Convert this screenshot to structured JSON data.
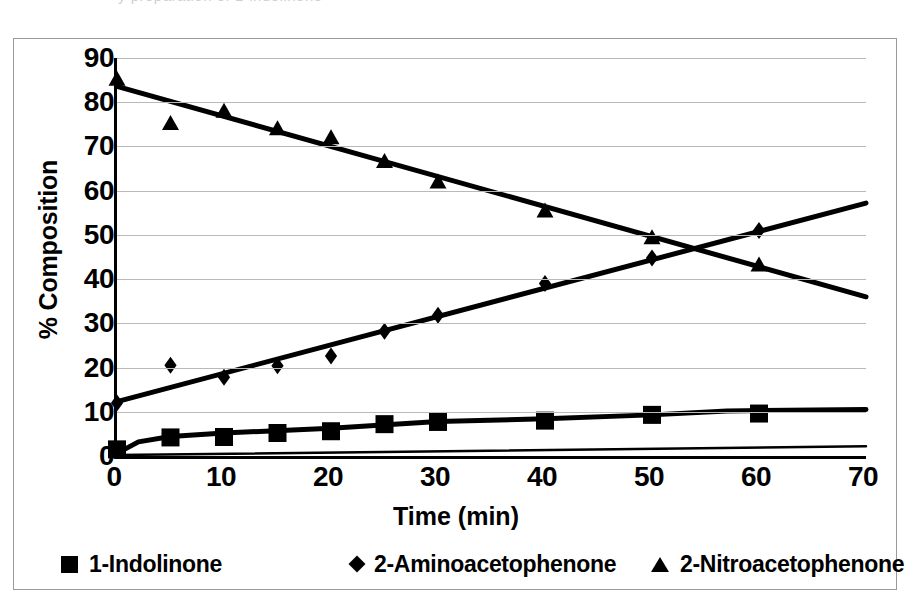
{
  "figure": {
    "top_crop_artifact": "y preparation of 1-indolinone"
  },
  "chart_data": {
    "type": "scatter",
    "title": "",
    "xlabel": "Time (min)",
    "ylabel": "% Composition",
    "xlim": [
      0,
      70
    ],
    "ylim": [
      0,
      90
    ],
    "xticks": [
      0,
      10,
      20,
      30,
      40,
      50,
      60,
      70
    ],
    "yticks": [
      0,
      10,
      20,
      30,
      40,
      50,
      60,
      70,
      80,
      90
    ],
    "grid": "horizontal",
    "legend_position": "bottom",
    "marker_color": "#000000",
    "line_color": "#000000",
    "series": [
      {
        "name": "1-Indolinone",
        "marker": "square",
        "x": [
          0,
          5,
          10,
          15,
          20,
          25,
          30,
          40,
          50,
          60
        ],
        "values": [
          1.5,
          4.2,
          4.3,
          5.2,
          5.6,
          7.2,
          7.7,
          8.0,
          9.3,
          9.6
        ],
        "trend_x": [
          0,
          2,
          5,
          10,
          20,
          30,
          40,
          50,
          57,
          70
        ],
        "trend_y": [
          0.6,
          3.2,
          4.4,
          5.2,
          6.3,
          7.8,
          8.4,
          9.3,
          10.2,
          10.5
        ]
      },
      {
        "name": "2-Aminoacetophenone",
        "marker": "diamond",
        "x": [
          0,
          5,
          10,
          15,
          20,
          25,
          30,
          40,
          50,
          60
        ],
        "values": [
          12.0,
          20.5,
          17.8,
          20.4,
          22.6,
          28.2,
          31.8,
          39.0,
          44.8,
          51.0
        ],
        "trend_x": [
          0,
          70
        ],
        "trend_y": [
          12.3,
          57.2
        ]
      },
      {
        "name": "2-Nitroacetophenone",
        "marker": "triangle",
        "x": [
          0,
          5,
          10,
          15,
          20,
          25,
          30,
          40,
          50,
          60
        ],
        "values": [
          85.0,
          75.0,
          77.8,
          73.8,
          71.8,
          66.4,
          61.8,
          55.2,
          49.2,
          43.0
        ],
        "trend_x": [
          0,
          70
        ],
        "trend_y": [
          83.6,
          36.0
        ]
      }
    ],
    "baseline_series": {
      "name": "axis-baseline-trend",
      "trend_x": [
        0,
        70
      ],
      "trend_y": [
        0.2,
        2.2
      ]
    }
  },
  "legend": {
    "items": [
      {
        "label": "1-Indolinone",
        "marker": "square"
      },
      {
        "label": "2-Aminoacetophenone",
        "marker": "diamond"
      },
      {
        "label": "2-Nitroacetophenone",
        "marker": "triangle"
      }
    ]
  }
}
